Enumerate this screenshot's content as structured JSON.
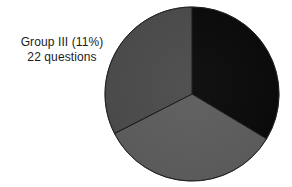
{
  "figure": {
    "background_color": "#ffffff",
    "width": 292,
    "height": 187
  },
  "annotation": {
    "name": "group-iii-callout",
    "line1": "Group III (11%)",
    "line2": "22 questions",
    "text_color": "#1b1b1b"
  },
  "chart_data": {
    "type": "pie",
    "title": "",
    "subtitle": "",
    "xlabel": "",
    "ylabel": "",
    "grid": false,
    "legend_position": "none",
    "start_angle_deg": 0,
    "direction": "clockwise",
    "center": {
      "x": 192,
      "y": 94
    },
    "radius": 87,
    "outline_color": "#ffffff",
    "separator_color": "#111111",
    "labels": [
      "Group I",
      "Group II",
      "Group III"
    ],
    "values": [
      33.6,
      33.9,
      32.5
    ],
    "unit": "percent",
    "annotations": [
      {
        "target": "Group III",
        "text": "Group III (11%)",
        "secondary_text": "22 questions",
        "percent": 11,
        "count": 22
      }
    ],
    "slices": [
      {
        "name": "Group I",
        "value": 33.6,
        "start_deg": 0,
        "end_deg": 121,
        "color": "#080808"
      },
      {
        "name": "Group II",
        "value": 33.9,
        "start_deg": 121,
        "end_deg": 243,
        "color": "#5c5c5c"
      },
      {
        "name": "Group III",
        "value": 32.5,
        "start_deg": 243,
        "end_deg": 360,
        "color": "#4a4a4a"
      }
    ]
  }
}
